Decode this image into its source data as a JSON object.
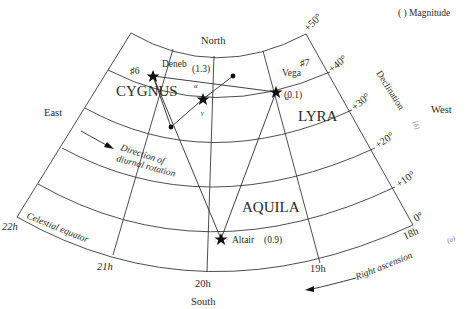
{
  "legend": {
    "text": "(    ) Magnitude"
  },
  "directions": {
    "north": "North",
    "south": "South",
    "east": "East",
    "west": "West"
  },
  "constellations": {
    "cygnus": {
      "name": "CYGNUS",
      "number": "♯6"
    },
    "lyra": {
      "name": "LYRA",
      "number": "♯7"
    },
    "aquila": {
      "name": "AQUILA"
    }
  },
  "stars": {
    "deneb": {
      "name": "Deneb",
      "magnitude": "(1.3)",
      "greek": "α"
    },
    "vega": {
      "name": "Vega",
      "magnitude": "(0.1)",
      "greek": "α"
    },
    "altair": {
      "name": "Altair",
      "magnitude": "(0.9)"
    },
    "gamma_cygni": {
      "greek": "γ"
    }
  },
  "declination": {
    "axis_label": "Declination",
    "symbol": "[δ]",
    "ticks": [
      "+50°",
      "+40°",
      "+30°",
      "+20°",
      "+10°",
      "0°"
    ]
  },
  "right_ascension": {
    "axis_label": "Right ascension",
    "symbol": "(α)",
    "ticks": [
      "22h",
      "21h",
      "20h",
      "19h",
      "18h"
    ]
  },
  "annotations": {
    "celestial_equator": "Celestial equator",
    "rotation_line1": "Direction of",
    "rotation_line2": "diurnal rotation"
  }
}
